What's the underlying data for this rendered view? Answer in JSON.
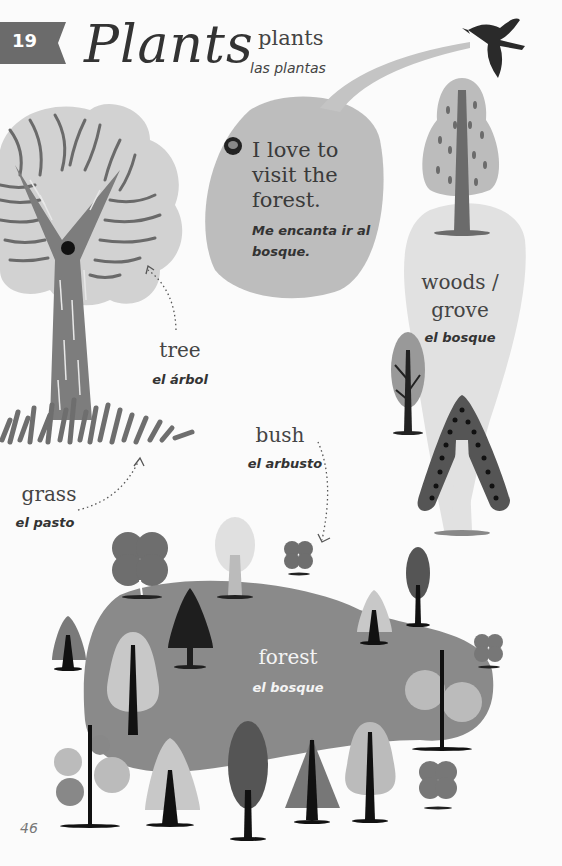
{
  "header": {
    "lesson_number": "19",
    "title_script": "Plants",
    "title_en": "plants",
    "title_es": "las plantas"
  },
  "speech_bubble": {
    "icon": "speech-bubble-icon",
    "en": "I love to visit the forest.",
    "es": "Me encanta ir al bosque."
  },
  "vocab": {
    "tree": {
      "en": "tree",
      "es": "el árbol"
    },
    "woods": {
      "en_line1": "woods /",
      "en_line2": "grove",
      "es": "el bosque"
    },
    "bush": {
      "en": "bush",
      "es": "el arbusto"
    },
    "grass": {
      "en": "grass",
      "es": "el pasto"
    },
    "forest": {
      "en": "forest",
      "es": "el bosque"
    }
  },
  "footer": {
    "page_number": "46"
  },
  "colors": {
    "background": "#fbfbfb",
    "badge": "#6b6b6b",
    "light_gray": "#cfcfcf",
    "mid_gray": "#8a8a8a",
    "dark_gray": "#555555",
    "black": "#1e1e1e"
  }
}
